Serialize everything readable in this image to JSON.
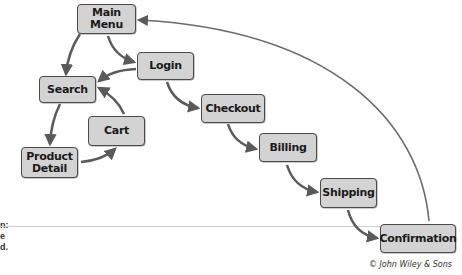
{
  "diagram": {
    "type": "navigation-flow",
    "colors": {
      "node_fill": "#d3d3d3",
      "node_border": "#4a4a4a",
      "arrow": "#5a5a5a",
      "background": "#ffffff"
    },
    "nodes": [
      {
        "id": "main-menu",
        "label": "Main\nMenu"
      },
      {
        "id": "login",
        "label": "Login"
      },
      {
        "id": "search",
        "label": "Search"
      },
      {
        "id": "cart",
        "label": "Cart"
      },
      {
        "id": "product-detail",
        "label": "Product\nDetail"
      },
      {
        "id": "checkout",
        "label": "Checkout"
      },
      {
        "id": "billing",
        "label": "Billing"
      },
      {
        "id": "shipping",
        "label": "Shipping"
      },
      {
        "id": "confirmation",
        "label": "Confirmation"
      }
    ],
    "edges": [
      {
        "from": "main-menu",
        "to": "search"
      },
      {
        "from": "main-menu",
        "to": "login"
      },
      {
        "from": "login",
        "to": "search"
      },
      {
        "from": "login",
        "to": "checkout"
      },
      {
        "from": "search",
        "to": "product-detail"
      },
      {
        "from": "product-detail",
        "to": "cart"
      },
      {
        "from": "cart",
        "to": "search"
      },
      {
        "from": "checkout",
        "to": "billing"
      },
      {
        "from": "billing",
        "to": "shipping"
      },
      {
        "from": "shipping",
        "to": "confirmation"
      },
      {
        "from": "confirmation",
        "to": "main-menu"
      }
    ]
  },
  "labels": {
    "main_menu_line1": "Main",
    "main_menu_line2": "Menu",
    "login": "Login",
    "search": "Search",
    "cart": "Cart",
    "product_detail_line1": "Product",
    "product_detail_line2": "Detail",
    "checkout": "Checkout",
    "billing": "Billing",
    "shipping": "Shipping",
    "confirmation": "Confirmation"
  },
  "left_margin_fragments": [
    "n:",
    "e",
    "d."
  ],
  "credit": "© John Wiley & Sons"
}
